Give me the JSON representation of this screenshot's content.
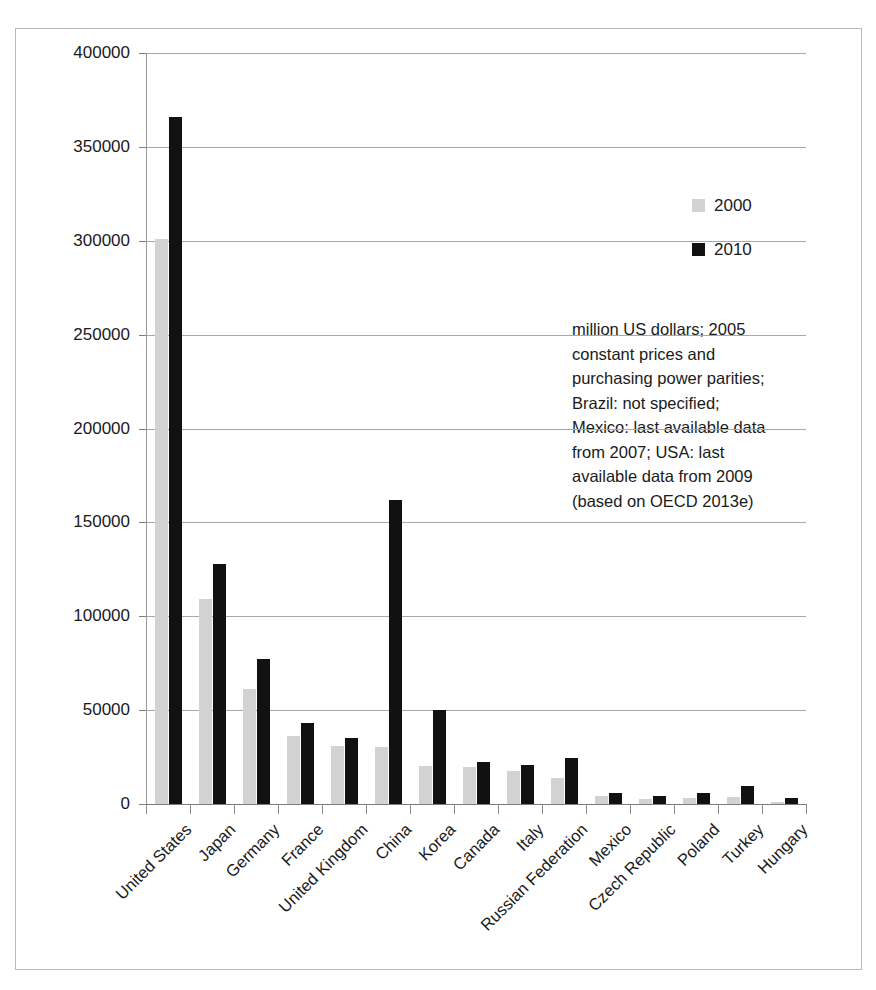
{
  "chart_data": {
    "type": "bar",
    "title": "",
    "subtitle": "",
    "xlabel": "",
    "ylabel": "",
    "ylim": [
      0,
      400000
    ],
    "ytick_step": 50000,
    "yticks": [
      "0",
      "50000",
      "100000",
      "150000",
      "200000",
      "250000",
      "300000",
      "350000",
      "400000"
    ],
    "grid": true,
    "legend_position": "top-right",
    "categories": [
      "United States",
      "Japan",
      "Germany",
      "France",
      "United Kingdom",
      "China",
      "Korea",
      "Canada",
      "Italy",
      "Russian Federation",
      "Mexico",
      "Czech Republic",
      "Poland",
      "Turkey",
      "Hungary"
    ],
    "series": [
      {
        "name": "2000",
        "color": "#d2d2d2",
        "values": [
          301000,
          109000,
          61000,
          36000,
          31000,
          30500,
          20000,
          19500,
          17500,
          14000,
          4500,
          2500,
          3000,
          3500,
          1200
        ]
      },
      {
        "name": "2010",
        "color": "#111111",
        "values": [
          366000,
          128000,
          77000,
          43000,
          35000,
          162000,
          50000,
          22500,
          21000,
          24500,
          6000,
          4500,
          5800,
          9500,
          3000
        ]
      }
    ],
    "annotation": [
      "million US dollars; 2005",
      "constant prices and",
      "purchasing power parities;",
      "Brazil: not specified;",
      "Mexico: last available data",
      "from 2007; USA: last",
      "available data from 2009",
      "(based on OECD 2013e)"
    ]
  }
}
